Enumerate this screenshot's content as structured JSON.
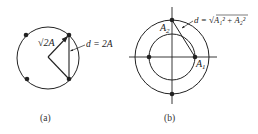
{
  "figure_a": {
    "caption": "(a)",
    "radius_label": "√2A",
    "chord_label": "d = 2A"
  },
  "figure_b": {
    "caption": "(b)",
    "label_a1": "A",
    "label_a1_sub": "1",
    "label_a2": "A",
    "label_a2_sub": "2",
    "distance_label_prefix": "d = ",
    "distance_label_expr": "A₁² + A₂²"
  },
  "colors": {
    "stroke": "#222222",
    "background": "#ffffff"
  }
}
